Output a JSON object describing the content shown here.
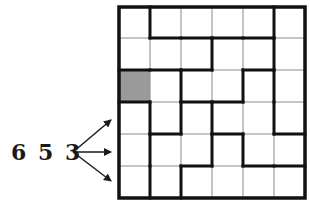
{
  "puzzle": {
    "label": "6 5 3",
    "rows": 6,
    "cols": 6,
    "shaded_cells": [
      [
        2,
        0
      ]
    ],
    "arrow_targets_rows": [
      3,
      4,
      5
    ],
    "thick_vertical": [
      [
        0,
        0
      ],
      [
        0,
        4
      ],
      [
        1,
        2
      ],
      [
        1,
        4
      ],
      [
        2,
        1
      ],
      [
        2,
        3
      ],
      [
        2,
        4
      ],
      [
        3,
        0
      ],
      [
        3,
        1
      ],
      [
        3,
        2
      ],
      [
        3,
        4
      ],
      [
        4,
        0
      ],
      [
        4,
        2
      ],
      [
        4,
        3
      ],
      [
        5,
        0
      ],
      [
        5,
        1
      ]
    ],
    "thick_horizontal": [
      [
        0,
        1
      ],
      [
        0,
        2
      ],
      [
        0,
        3
      ],
      [
        0,
        4
      ],
      [
        1,
        0
      ],
      [
        1,
        1
      ],
      [
        1,
        2
      ],
      [
        1,
        4
      ],
      [
        2,
        0
      ],
      [
        2,
        2
      ],
      [
        2,
        3
      ],
      [
        3,
        1
      ],
      [
        3,
        3
      ],
      [
        3,
        5
      ],
      [
        4,
        2
      ],
      [
        4,
        4
      ],
      [
        4,
        5
      ]
    ]
  },
  "colors": {
    "line": "#111111",
    "thin_line": "#8a8a8a",
    "shade": "#9a9a9a",
    "background": "#ffffff"
  }
}
